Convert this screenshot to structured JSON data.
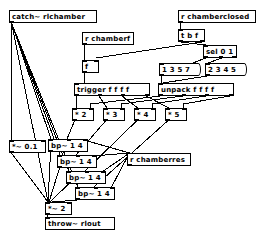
{
  "patch": {
    "title": "catch~ rlchamber",
    "canvas": {
      "width": 262,
      "height": 234,
      "background": "#ffffff"
    },
    "colors": {
      "box_border": "#000000",
      "box_fill": "#ffffff",
      "wire": "#000000",
      "text": "#000000"
    }
  },
  "objects": {
    "catch": {
      "label": "catch~ rlchamber",
      "kind": "object",
      "x": 9,
      "y": 10,
      "w": 88,
      "h": 13
    },
    "r_chamberf": {
      "label": "r chamberf",
      "kind": "object",
      "x": 82,
      "y": 32,
      "w": 52,
      "h": 13
    },
    "f_box": {
      "label": "f",
      "kind": "object",
      "x": 82,
      "y": 60,
      "w": 17,
      "h": 13
    },
    "trigger": {
      "label": "trigger f f f f",
      "kind": "object",
      "x": 74,
      "y": 83,
      "w": 76,
      "h": 13
    },
    "r_closed": {
      "label": "r chamberclosed",
      "kind": "object",
      "x": 178,
      "y": 10,
      "w": 78,
      "h": 13
    },
    "t_b_f": {
      "label": "t b f",
      "kind": "object",
      "x": 178,
      "y": 29,
      "w": 27,
      "h": 13
    },
    "sel_0_1": {
      "label": "sel 0 1",
      "kind": "object",
      "x": 203,
      "y": 45,
      "w": 34,
      "h": 13
    },
    "msg_1357": {
      "label": "1 3 5 7",
      "kind": "message",
      "x": 159,
      "y": 63,
      "w": 38,
      "h": 13
    },
    "msg_2345": {
      "label": "2 3 4 5",
      "kind": "message",
      "x": 205,
      "y": 63,
      "w": 38,
      "h": 13
    },
    "unpack": {
      "label": "unpack f f f f",
      "kind": "object",
      "x": 158,
      "y": 83,
      "w": 76,
      "h": 13
    },
    "mult2": {
      "label": "* 2",
      "kind": "object",
      "x": 72,
      "y": 108,
      "w": 22,
      "h": 13
    },
    "mult3": {
      "label": "* 3",
      "kind": "object",
      "x": 103,
      "y": 108,
      "w": 22,
      "h": 13
    },
    "mult4": {
      "label": "* 4",
      "kind": "object",
      "x": 134,
      "y": 108,
      "w": 22,
      "h": 13
    },
    "mult5": {
      "label": "* 5",
      "kind": "object",
      "x": 165,
      "y": 108,
      "w": 22,
      "h": 13
    },
    "mult_sig_01": {
      "label": "*~ 0.1",
      "kind": "object",
      "x": 9,
      "y": 140,
      "w": 37,
      "h": 13
    },
    "bp1": {
      "label": "bp~ 1 4",
      "kind": "object",
      "x": 48,
      "y": 139,
      "w": 40,
      "h": 13
    },
    "bp2": {
      "label": "bp~ 1 4",
      "kind": "object",
      "x": 57,
      "y": 155,
      "w": 40,
      "h": 13
    },
    "bp3": {
      "label": "bp~ 1 4",
      "kind": "object",
      "x": 66,
      "y": 171,
      "w": 40,
      "h": 13
    },
    "bp4": {
      "label": "bp~ 1 4",
      "kind": "object",
      "x": 75,
      "y": 187,
      "w": 40,
      "h": 13
    },
    "r_res": {
      "label": "r chamberres",
      "kind": "object",
      "x": 127,
      "y": 153,
      "w": 64,
      "h": 13
    },
    "mult_sig_2": {
      "label": "*~ 2",
      "kind": "object",
      "x": 45,
      "y": 202,
      "w": 27,
      "h": 13
    },
    "throw": {
      "label": "throw~ rlout",
      "kind": "object",
      "x": 45,
      "y": 217,
      "w": 70,
      "h": 13
    }
  },
  "wires": [
    {
      "from": "catch",
      "to": "bp1",
      "kind": "signal"
    },
    {
      "from": "catch",
      "to": "bp2",
      "kind": "signal"
    },
    {
      "from": "catch",
      "to": "bp3",
      "kind": "signal"
    },
    {
      "from": "catch",
      "to": "bp4",
      "kind": "signal"
    },
    {
      "from": "catch",
      "to": "mult_sig_01",
      "kind": "signal"
    },
    {
      "from": "r_chamberf",
      "to": "f_box",
      "kind": "control"
    },
    {
      "from": "f_box",
      "to": "trigger",
      "kind": "control"
    },
    {
      "from": "trigger",
      "to": "mult2",
      "kind": "control"
    },
    {
      "from": "trigger",
      "to": "mult3",
      "kind": "control"
    },
    {
      "from": "trigger",
      "to": "mult4",
      "kind": "control"
    },
    {
      "from": "trigger",
      "to": "mult5",
      "kind": "control"
    },
    {
      "from": "r_closed",
      "to": "t_b_f",
      "kind": "control"
    },
    {
      "from": "t_b_f",
      "to": "sel_0_1",
      "kind": "control"
    },
    {
      "from": "t_b_f",
      "to": "f_box",
      "kind": "control"
    },
    {
      "from": "sel_0_1",
      "to": "msg_1357",
      "kind": "control"
    },
    {
      "from": "sel_0_1",
      "to": "msg_2345",
      "kind": "control"
    },
    {
      "from": "msg_1357",
      "to": "unpack",
      "kind": "control"
    },
    {
      "from": "msg_2345",
      "to": "unpack",
      "kind": "control"
    },
    {
      "from": "unpack",
      "to": "mult2",
      "kind": "control"
    },
    {
      "from": "unpack",
      "to": "mult3",
      "kind": "control"
    },
    {
      "from": "unpack",
      "to": "mult4",
      "kind": "control"
    },
    {
      "from": "unpack",
      "to": "mult5",
      "kind": "control"
    },
    {
      "from": "mult2",
      "to": "bp1",
      "kind": "control"
    },
    {
      "from": "mult3",
      "to": "bp2",
      "kind": "control"
    },
    {
      "from": "mult4",
      "to": "bp3",
      "kind": "control"
    },
    {
      "from": "mult5",
      "to": "bp4",
      "kind": "control"
    },
    {
      "from": "r_res",
      "to": "bp1",
      "kind": "control"
    },
    {
      "from": "r_res",
      "to": "bp2",
      "kind": "control"
    },
    {
      "from": "r_res",
      "to": "bp3",
      "kind": "control"
    },
    {
      "from": "r_res",
      "to": "bp4",
      "kind": "control"
    },
    {
      "from": "bp1",
      "to": "mult_sig_2",
      "kind": "signal"
    },
    {
      "from": "bp2",
      "to": "mult_sig_2",
      "kind": "signal"
    },
    {
      "from": "bp3",
      "to": "mult_sig_2",
      "kind": "signal"
    },
    {
      "from": "bp4",
      "to": "mult_sig_2",
      "kind": "signal"
    },
    {
      "from": "mult_sig_01",
      "to": "mult_sig_2",
      "kind": "signal"
    },
    {
      "from": "mult_sig_2",
      "to": "throw",
      "kind": "signal"
    }
  ]
}
